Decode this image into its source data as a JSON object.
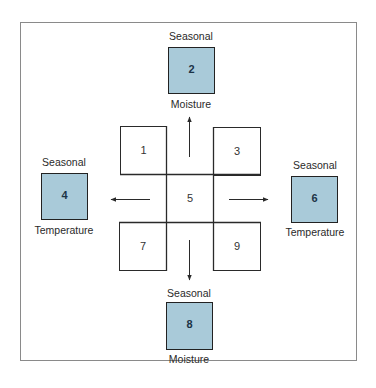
{
  "colors": {
    "shaded_fill": "#a9cad9",
    "line": "#2a2a2a",
    "frame": "#8a8a8a"
  },
  "grid": {
    "cells": [
      {
        "id": "1",
        "label": "1"
      },
      {
        "id": "3",
        "label": "3"
      },
      {
        "id": "5",
        "label": "5"
      },
      {
        "id": "7",
        "label": "7"
      },
      {
        "id": "9",
        "label": "9"
      }
    ]
  },
  "outer": {
    "top": {
      "number": "2",
      "above": "Seasonal",
      "below": "Moisture"
    },
    "left": {
      "number": "4",
      "above": "Seasonal",
      "below": "Temperature"
    },
    "right": {
      "number": "6",
      "above": "Seasonal",
      "below": "Temperature"
    },
    "bottom": {
      "number": "8",
      "above": "Seasonal",
      "below": "Moisture"
    }
  },
  "arrows": [
    {
      "direction": "up",
      "from": "5",
      "to": "2"
    },
    {
      "direction": "left",
      "from": "5",
      "to": "4"
    },
    {
      "direction": "right",
      "from": "5",
      "to": "6"
    },
    {
      "direction": "down",
      "from": "5",
      "to": "8"
    }
  ]
}
